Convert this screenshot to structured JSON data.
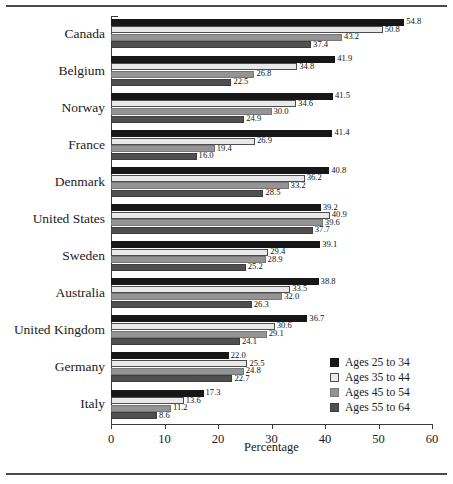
{
  "chart_data": {
    "type": "bar",
    "orientation": "horizontal",
    "title": "",
    "xlabel": "Percentage",
    "ylabel": "",
    "xlim": [
      0,
      60
    ],
    "xticks": [
      0,
      10,
      20,
      30,
      40,
      50,
      60
    ],
    "xtick_labels": [
      "0",
      "10",
      "20",
      "30",
      "40",
      "50",
      "60"
    ],
    "grid": false,
    "legend_position": "lower-right-inside",
    "categories": [
      "Canada",
      "Belgium",
      "Norway",
      "France",
      "Denmark",
      "United States",
      "Sweden",
      "Australia",
      "United Kingdom",
      "Germany",
      "Italy"
    ],
    "series": [
      {
        "name": "Ages 25 to 34",
        "color": "#171717",
        "values": [
          54.8,
          41.9,
          41.5,
          41.4,
          40.8,
          39.2,
          39.1,
          38.8,
          36.7,
          22.0,
          17.3
        ],
        "labels": [
          "54.8",
          "41.9",
          "41.5",
          "41.4",
          "40.8",
          "39.2",
          "39.1",
          "38.8",
          "36.7",
          "22.0",
          "17.3"
        ]
      },
      {
        "name": "Ages 35 to 44",
        "color": "#e9e9e9",
        "values": [
          50.8,
          34.8,
          34.6,
          26.9,
          36.2,
          40.9,
          29.4,
          33.5,
          30.6,
          25.5,
          13.6
        ],
        "labels": [
          "50.8",
          "34.8",
          "34.6",
          "26.9",
          "36.2",
          "40.9",
          "29.4",
          "33.5",
          "30.6",
          "25.5",
          "13.6"
        ]
      },
      {
        "name": "Ages 45 to 54",
        "color": "#949494",
        "values": [
          43.2,
          26.8,
          30.0,
          19.4,
          33.2,
          39.6,
          28.9,
          32.0,
          29.1,
          24.8,
          11.2
        ],
        "labels": [
          "43.2",
          "26.8",
          "30.0",
          "19.4",
          "33.2",
          "39.6",
          "28.9",
          "32.0",
          "29.1",
          "24.8",
          "11.2"
        ]
      },
      {
        "name": "Ages 55 to 64",
        "color": "#4f4f4f",
        "values": [
          37.4,
          22.5,
          24.9,
          16.0,
          28.5,
          37.7,
          25.2,
          26.3,
          24.1,
          22.7,
          8.6
        ],
        "labels": [
          "37.4",
          "22.5",
          "24.9",
          "16.0",
          "28.5",
          "37.7",
          "25.2",
          "26.3",
          "24.1",
          "22.7",
          "8.6"
        ]
      }
    ]
  }
}
